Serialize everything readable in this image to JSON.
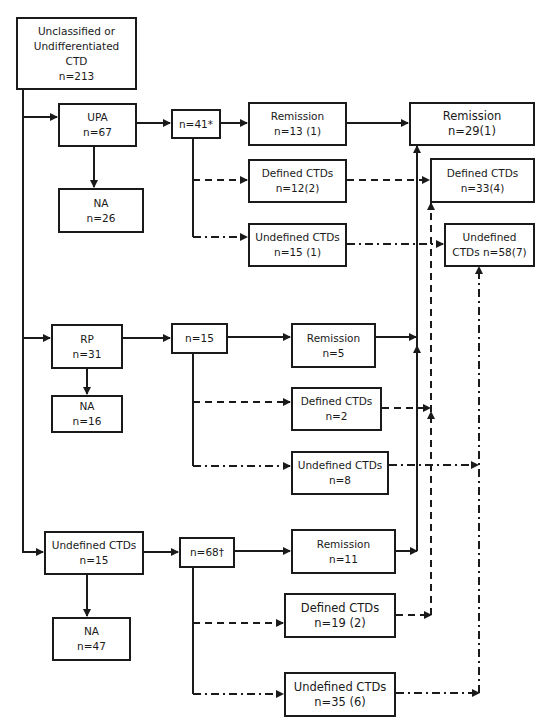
{
  "diagram": {
    "root": {
      "lines": [
        "Unclassified or",
        "Undifferentiated",
        "CTD",
        "n=213"
      ]
    },
    "upa": {
      "lines": [
        "UPA",
        "n=67"
      ]
    },
    "upa_na": {
      "lines": [
        "NA",
        "n=26"
      ]
    },
    "upa_followed": {
      "lines": [
        "n=41*"
      ]
    },
    "upa_remission": {
      "lines": [
        "Remission",
        "n=13 (1)"
      ]
    },
    "upa_defined": {
      "lines": [
        "Defined CTDs",
        "n=12(2)"
      ]
    },
    "upa_undefined": {
      "lines": [
        "Undefined CTDs",
        "n=15 (1)"
      ]
    },
    "rp": {
      "lines": [
        "RP",
        "n=31"
      ]
    },
    "rp_na": {
      "lines": [
        "NA",
        "n=16"
      ]
    },
    "rp_followed": {
      "lines": [
        "n=15"
      ]
    },
    "rp_remission": {
      "lines": [
        "Remission",
        "n=5"
      ]
    },
    "rp_defined": {
      "lines": [
        "Defined CTDs",
        "n=2"
      ]
    },
    "rp_undefined": {
      "lines": [
        "Undefined CTDs",
        "n=8"
      ]
    },
    "uctd": {
      "lines": [
        "Undefined CTDs",
        "n=15"
      ]
    },
    "uctd_na": {
      "lines": [
        "NA",
        "n=47"
      ]
    },
    "uctd_followed": {
      "lines": [
        "n=68†"
      ]
    },
    "uctd_remission": {
      "lines": [
        "Remission",
        "n=11"
      ]
    },
    "uctd_defined": {
      "lines": [
        "Defined CTDs",
        "n=19 (2)"
      ]
    },
    "uctd_undefined": {
      "lines": [
        "Undefined CTDs",
        "n=35 (6)"
      ]
    },
    "total_remission": {
      "lines": [
        "Remission",
        "n=29(1)"
      ]
    },
    "total_defined": {
      "lines": [
        "Defined CTDs",
        "n=33(4)"
      ]
    },
    "total_undefined": {
      "lines": [
        "Undefined",
        "CTDs n=58(7)"
      ]
    }
  },
  "legend_line_styles": {
    "remission": "solid",
    "defined_ctds": "dashed",
    "undefined_ctds": "dash-dot"
  },
  "colors": {
    "stroke": "#1a1a1a",
    "background": "#ffffff"
  }
}
